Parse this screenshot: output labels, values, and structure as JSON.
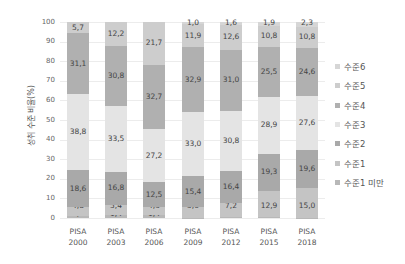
{
  "chart_data": {
    "type": "bar",
    "stacked": true,
    "title": "",
    "xlabel": "",
    "ylabel": "성취 수준 비율(%)",
    "ylim": [
      0,
      100
    ],
    "yticks": [
      0,
      10,
      20,
      30,
      40,
      50,
      60,
      70,
      80,
      90,
      100
    ],
    "grid": true,
    "legend_position": "right",
    "categories": [
      "PISA 2000",
      "PISA 2003",
      "PISA 2006",
      "PISA 2009",
      "PISA 2012",
      "PISA 2015",
      "PISA 2018"
    ],
    "series": [
      {
        "name": "수준1 미만",
        "color": "#b8b8b8",
        "values": [
          0.9,
          1.4,
          1.4,
          0.2,
          0.4,
          0.7,
          0.1
        ],
        "labels": [
          "0,9",
          "1,4",
          "1,4",
          "0,2",
          "0,4",
          "0,7",
          "0,1"
        ]
      },
      {
        "name": "수준1",
        "color": "#c4c4c4",
        "values": [
          4.8,
          5.4,
          4.3,
          5.6,
          7.2,
          12.9,
          15.0
        ],
        "labels": [
          "4,8",
          "5,4",
          "4,3",
          "5,6",
          "7,2",
          "12,9",
          "15,0"
        ]
      },
      {
        "name": "수준2",
        "color": "#a9a9a9",
        "values": [
          18.6,
          16.8,
          12.5,
          15.4,
          16.4,
          19.3,
          19.6
        ],
        "labels": [
          "18,6",
          "16,8",
          "12,5",
          "15,4",
          "16,4",
          "19,3",
          "19,6"
        ]
      },
      {
        "name": "수준3",
        "color": "#e4e4e4",
        "values": [
          38.8,
          33.5,
          27.2,
          33.0,
          30.8,
          28.9,
          27.6
        ],
        "labels": [
          "38,8",
          "33,5",
          "27,2",
          "33,0",
          "30,8",
          "28,9",
          "27,6"
        ]
      },
      {
        "name": "수준4",
        "color": "#b0b0b0",
        "values": [
          31.1,
          30.8,
          32.7,
          32.9,
          31.0,
          25.5,
          24.6
        ],
        "labels": [
          "31,1",
          "30,8",
          "32,7",
          "32,9",
          "31,0",
          "25,5",
          "24,6"
        ]
      },
      {
        "name": "수준5",
        "color": "#cdcdcd",
        "values": [
          5.7,
          12.2,
          21.7,
          11.9,
          12.6,
          10.8,
          10.8
        ],
        "labels": [
          "5,7",
          "12,2",
          "21,7",
          "11,9",
          "12,6",
          "10,8",
          "10,8"
        ]
      },
      {
        "name": "수준6",
        "color": "#d6d6d6",
        "values": [
          0.0,
          0.0,
          0.0,
          1.0,
          1.6,
          1.9,
          2.3
        ],
        "labels": [
          "",
          "",
          "",
          "1,0",
          "1,6",
          "1,9",
          "2,3"
        ]
      }
    ],
    "x_labels": [
      {
        "line1": "PISA",
        "line2": "2000"
      },
      {
        "line1": "PISA",
        "line2": "2003"
      },
      {
        "line1": "PISA",
        "line2": "2006"
      },
      {
        "line1": "PISA",
        "line2": "2009"
      },
      {
        "line1": "PISA",
        "line2": "2012"
      },
      {
        "line1": "PISA",
        "line2": "2015"
      },
      {
        "line1": "PISA",
        "line2": "2018"
      }
    ],
    "legend": [
      "수준6",
      "수준5",
      "수준4",
      "수준3",
      "수준2",
      "수준1",
      "수준1 미만"
    ]
  }
}
